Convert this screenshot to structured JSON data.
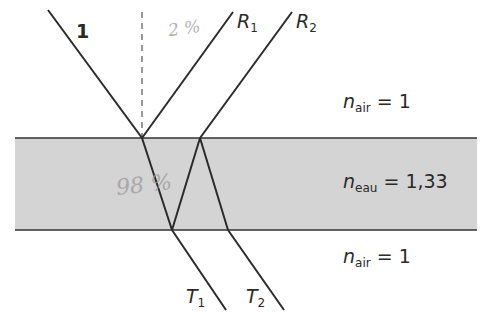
{
  "diagram": {
    "colors": {
      "ray": "#2b2b2b",
      "water_fill": "#d4d4d4",
      "interface": "#333333",
      "normal": "#555555",
      "handwriting": "#9a9a9a"
    },
    "rays": {
      "incident": {
        "label": "1"
      },
      "reflected_1": {
        "label": "R",
        "sub": "1"
      },
      "reflected_2": {
        "label": "R",
        "sub": "2"
      },
      "transmitted_1": {
        "label": "T",
        "sub": "1"
      },
      "transmitted_2": {
        "label": "T",
        "sub": "2"
      }
    },
    "media": {
      "top": {
        "n": "n",
        "sub": "air",
        "value": "= 1"
      },
      "middle": {
        "n": "n",
        "sub": "eau",
        "value": "= 1,33"
      },
      "bottom": {
        "n": "n",
        "sub": "air",
        "value": "= 1"
      }
    },
    "annotations": {
      "handwritten_top": "2 %",
      "handwritten_middle": "98 %"
    }
  }
}
